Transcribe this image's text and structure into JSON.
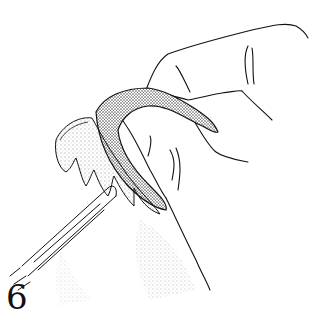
{
  "figure": {
    "number": "6"
  },
  "colors": {
    "ink": "#111111",
    "background": "#ffffff"
  }
}
